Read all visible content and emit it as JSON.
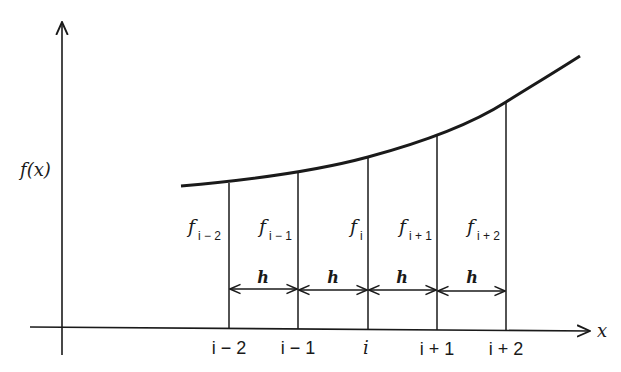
{
  "diagram": {
    "y_axis_label": "f(x)",
    "x_axis_label": "x",
    "spacing_label": "h",
    "points": [
      {
        "x_label": "i − 2",
        "f_label": "f",
        "f_sub": "i − 2"
      },
      {
        "x_label": "i − 1",
        "f_label": "f",
        "f_sub": "i − 1"
      },
      {
        "x_label": "i",
        "f_label": "f",
        "f_sub": "i"
      },
      {
        "x_label": "i + 1",
        "f_label": "f",
        "f_sub": "i + 1"
      },
      {
        "x_label": "i + 2",
        "f_label": "f",
        "f_sub": "i + 2"
      }
    ],
    "intervals": [
      "h",
      "h",
      "h",
      "h"
    ],
    "colors": {
      "ink": "#1a1a1a",
      "background": "#ffffff"
    }
  }
}
